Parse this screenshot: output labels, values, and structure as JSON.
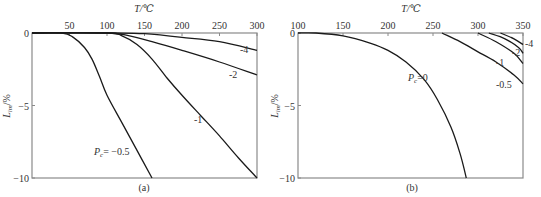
{
  "figure": {
    "captions": [
      "(a)",
      "(b)"
    ]
  },
  "chart_data": [
    {
      "type": "line",
      "panel": "(a)",
      "title": "",
      "xlabel": "T/℃",
      "ylabel": "L_im/%",
      "xlim": [
        0,
        300
      ],
      "ylim": [
        -10,
        0
      ],
      "x_ticks": [
        0,
        50,
        100,
        150,
        200,
        250,
        300
      ],
      "y_ticks": [
        0,
        -5,
        -10
      ],
      "x_axis_position": "top",
      "grid": false,
      "series": [
        {
          "name": "Pc=-0.5",
          "label": "P_c= -0.5",
          "x": [
            0,
            40,
            55,
            70,
            80,
            90,
            100,
            120,
            140,
            160
          ],
          "y": [
            0,
            0,
            -0.3,
            -1.0,
            -1.8,
            -3.0,
            -4.3,
            -6.2,
            -8.1,
            -10
          ]
        },
        {
          "name": "Pc=-1",
          "label": "-1",
          "x": [
            0,
            100,
            120,
            140,
            160,
            180,
            200,
            225,
            250,
            275,
            300
          ],
          "y": [
            0,
            0,
            -0.2,
            -0.8,
            -1.8,
            -3.1,
            -4.3,
            -5.7,
            -7.1,
            -8.6,
            -10
          ]
        },
        {
          "name": "Pc=-2",
          "label": "-2",
          "x": [
            0,
            100,
            130,
            160,
            200,
            250,
            300
          ],
          "y": [
            0,
            0,
            -0.2,
            -0.6,
            -1.2,
            -2.0,
            -2.9
          ]
        },
        {
          "name": "Pc=-4",
          "label": "-4",
          "x": [
            0,
            110,
            150,
            200,
            250,
            300
          ],
          "y": [
            0,
            0,
            -0.05,
            -0.3,
            -0.6,
            -1.2
          ]
        }
      ]
    },
    {
      "type": "line",
      "panel": "(b)",
      "title": "",
      "xlabel": "T/℃",
      "ylabel": "L_im/%",
      "xlim": [
        100,
        350
      ],
      "ylim": [
        -10,
        0
      ],
      "x_ticks": [
        100,
        150,
        200,
        250,
        300,
        350
      ],
      "y_ticks": [
        0,
        -5,
        -10
      ],
      "x_axis_position": "top",
      "grid": false,
      "series": [
        {
          "name": "Pc=0",
          "label": "P_c=0",
          "x": [
            100,
            120,
            150,
            180,
            200,
            220,
            240,
            255,
            270,
            280,
            287
          ],
          "y": [
            0,
            0,
            -0.2,
            -0.7,
            -1.2,
            -2.0,
            -3.2,
            -4.6,
            -6.5,
            -8.3,
            -10
          ]
        },
        {
          "name": "Pc=-0.5",
          "label": "-0.5",
          "x": [
            260,
            280,
            300,
            320,
            340,
            350
          ],
          "y": [
            0,
            -0.6,
            -1.3,
            -2.0,
            -2.9,
            -3.5
          ]
        },
        {
          "name": "Pc=-1",
          "label": "-1",
          "x": [
            300,
            320,
            340,
            350
          ],
          "y": [
            0,
            -0.6,
            -1.4,
            -2.1
          ]
        },
        {
          "name": "Pc=-2",
          "label": "-2",
          "x": [
            312,
            330,
            345,
            350
          ],
          "y": [
            0,
            -0.4,
            -1.0,
            -1.4
          ]
        },
        {
          "name": "Pc=-4",
          "label": "-4",
          "x": [
            325,
            340,
            350
          ],
          "y": [
            0,
            -0.4,
            -0.8
          ]
        }
      ]
    }
  ]
}
